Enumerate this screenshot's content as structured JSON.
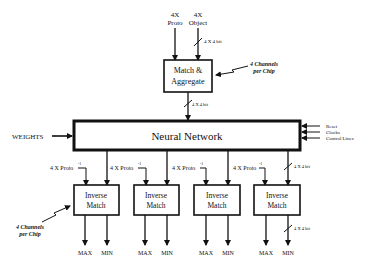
{
  "diagram": {
    "inputs_top": {
      "proto": {
        "line1": "4X",
        "line2": "Proto"
      },
      "object": {
        "line1": "4X",
        "line2": "Object"
      },
      "bus_label": "4 X 4 bit"
    },
    "match_aggregate": {
      "line1": "Match &",
      "line2": "Aggregate",
      "note_line1": "4 Channels",
      "note_line2": "per Chip",
      "bus_label": "4 X 4 bit"
    },
    "neural_network": {
      "label": "Neural Network",
      "weights_label": "WEIGHTS",
      "control_inputs": [
        "Reset",
        "Clocks",
        "Control Lines"
      ]
    },
    "inverse_match_blocks": [
      {
        "line1": "Inverse",
        "line2": "Match",
        "input_label": "4 X Proto",
        "sup": "-1",
        "outputs": [
          "MAX",
          "MIN"
        ]
      },
      {
        "line1": "Inverse",
        "line2": "Match",
        "input_label": "4 X Proto",
        "sup": "-1",
        "outputs": [
          "MAX",
          "MIN"
        ]
      },
      {
        "line1": "Inverse",
        "line2": "Match",
        "input_label": "4 X Proto",
        "sup": "-1",
        "outputs": [
          "MAX",
          "MIN"
        ]
      },
      {
        "line1": "Inverse",
        "line2": "Match",
        "input_label": "4 X Proto",
        "sup": "-1",
        "outputs": [
          "MAX",
          "MIN"
        ]
      }
    ],
    "right_bus_label": "4 X 4 bit",
    "bottom_bus_label": "4 X 4 bit",
    "bottom_note": {
      "line1": "4 Channels",
      "line2": "per Chip"
    }
  }
}
